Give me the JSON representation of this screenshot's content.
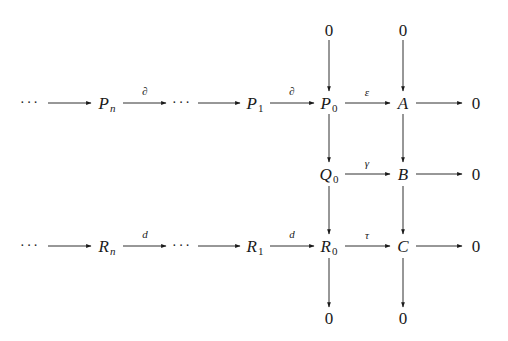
{
  "diagram": {
    "type": "commutative-diagram",
    "rows": {
      "top": {
        "nodes": [
          {
            "id": "zero_top_p0",
            "base": "0",
            "sub": ""
          },
          {
            "id": "zero_top_a",
            "base": "0",
            "sub": ""
          }
        ]
      },
      "row1": {
        "nodes": [
          {
            "id": "dots_p_left",
            "base": "···",
            "sub": ""
          },
          {
            "id": "P_n",
            "base": "P",
            "sub": "n"
          },
          {
            "id": "dots_p_mid",
            "base": "···",
            "sub": ""
          },
          {
            "id": "P_1",
            "base": "P",
            "sub": "1"
          },
          {
            "id": "P_0",
            "base": "P",
            "sub": "0"
          },
          {
            "id": "A",
            "base": "A",
            "sub": ""
          },
          {
            "id": "zero_right_a",
            "base": "0",
            "sub": ""
          }
        ]
      },
      "row2": {
        "nodes": [
          {
            "id": "Q_0",
            "base": "Q",
            "sub": "0"
          },
          {
            "id": "B",
            "base": "B",
            "sub": ""
          },
          {
            "id": "zero_right_b",
            "base": "0",
            "sub": ""
          }
        ]
      },
      "row3": {
        "nodes": [
          {
            "id": "dots_r_left",
            "base": "···",
            "sub": ""
          },
          {
            "id": "R_n",
            "base": "R",
            "sub": "n"
          },
          {
            "id": "dots_r_mid",
            "base": "···",
            "sub": ""
          },
          {
            "id": "R_1",
            "base": "R",
            "sub": "1"
          },
          {
            "id": "R_0",
            "base": "R",
            "sub": "0"
          },
          {
            "id": "C",
            "base": "C",
            "sub": ""
          },
          {
            "id": "zero_right_c",
            "base": "0",
            "sub": ""
          }
        ]
      },
      "bottom": {
        "nodes": [
          {
            "id": "zero_bottom_r0",
            "base": "0",
            "sub": ""
          },
          {
            "id": "zero_bottom_c",
            "base": "0",
            "sub": ""
          }
        ]
      }
    },
    "arrow_labels": {
      "pn_to_dots": "∂",
      "p1_to_p0": "∂",
      "p0_to_a": "ε",
      "q0_to_b": "γ",
      "rn_to_dots": "d",
      "r1_to_r0": "d",
      "r0_to_c": "τ"
    },
    "arrows": [
      {
        "from": "dots_p_left",
        "to": "P_n",
        "label": ""
      },
      {
        "from": "P_n",
        "to": "dots_p_mid",
        "label": "∂"
      },
      {
        "from": "dots_p_mid",
        "to": "P_1",
        "label": ""
      },
      {
        "from": "P_1",
        "to": "P_0",
        "label": "∂"
      },
      {
        "from": "P_0",
        "to": "A",
        "label": "ε"
      },
      {
        "from": "A",
        "to": "zero_right_a",
        "label": ""
      },
      {
        "from": "Q_0",
        "to": "B",
        "label": "γ"
      },
      {
        "from": "B",
        "to": "zero_right_b",
        "label": ""
      },
      {
        "from": "dots_r_left",
        "to": "R_n",
        "label": ""
      },
      {
        "from": "R_n",
        "to": "dots_r_mid",
        "label": "d"
      },
      {
        "from": "dots_r_mid",
        "to": "R_1",
        "label": ""
      },
      {
        "from": "R_1",
        "to": "R_0",
        "label": "d"
      },
      {
        "from": "R_0",
        "to": "C",
        "label": "τ"
      },
      {
        "from": "C",
        "to": "zero_right_c",
        "label": ""
      },
      {
        "from": "zero_top_p0",
        "to": "P_0",
        "label": ""
      },
      {
        "from": "P_0",
        "to": "Q_0",
        "label": ""
      },
      {
        "from": "Q_0",
        "to": "R_0",
        "label": ""
      },
      {
        "from": "R_0",
        "to": "zero_bottom_r0",
        "label": ""
      },
      {
        "from": "zero_top_a",
        "to": "A",
        "label": ""
      },
      {
        "from": "A",
        "to": "B",
        "label": ""
      },
      {
        "from": "B",
        "to": "C",
        "label": ""
      },
      {
        "from": "C",
        "to": "zero_bottom_c",
        "label": ""
      }
    ],
    "colors": {
      "ink": "#1a1a1a",
      "background": "#ffffff"
    }
  }
}
